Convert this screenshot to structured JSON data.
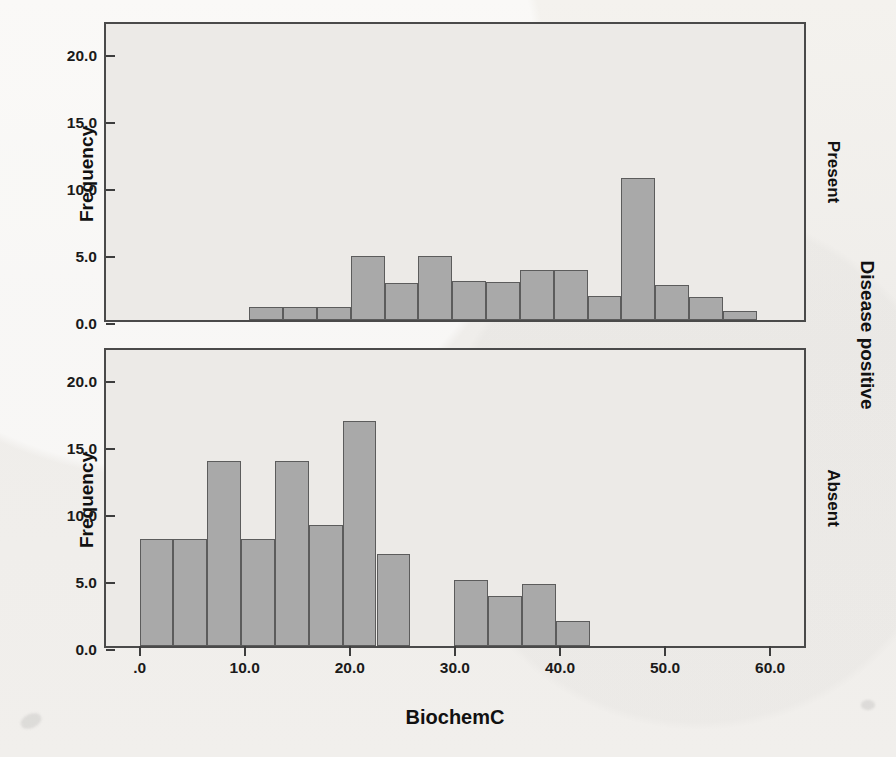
{
  "chart_data": {
    "type": "bar",
    "title": "",
    "xlabel": "BiochemC",
    "ylabel": "Frequency",
    "grid": false,
    "legend": "none",
    "panel_label": "Disease positive",
    "xlim": [
      -3.2,
      63.6
    ],
    "ylim": [
      0,
      22.4
    ],
    "xticks": [
      ".0",
      "10.0",
      "20.0",
      "30.0",
      "40.0",
      "50.0",
      "60.0"
    ],
    "xtick_values": [
      0,
      10,
      20,
      30,
      40,
      50,
      60
    ],
    "yticks": [
      "0.0",
      "5.0",
      "10.0",
      "15.0",
      "20.0"
    ],
    "ytick_values": [
      0,
      5,
      10,
      15,
      20
    ],
    "bin_width": 3.22,
    "bar_color": "#a9a9a9",
    "bar_edge_color": "#5c5c5c",
    "panels": [
      {
        "name": "Present",
        "row": 0,
        "bins": [
          {
            "x0": 10.43,
            "x1": 13.65,
            "value": 0.95
          },
          {
            "x0": 13.65,
            "x1": 16.87,
            "value": 0.95
          },
          {
            "x0": 16.87,
            "x1": 20.09,
            "value": 0.95
          },
          {
            "x0": 20.09,
            "x1": 23.31,
            "value": 4.75
          },
          {
            "x0": 23.31,
            "x1": 26.53,
            "value": 2.8
          },
          {
            "x0": 26.53,
            "x1": 29.75,
            "value": 4.75
          },
          {
            "x0": 29.75,
            "x1": 32.97,
            "value": 2.95
          },
          {
            "x0": 32.97,
            "x1": 36.19,
            "value": 2.85
          },
          {
            "x0": 36.19,
            "x1": 39.41,
            "value": 3.75
          },
          {
            "x0": 39.41,
            "x1": 42.63,
            "value": 3.75
          },
          {
            "x0": 42.63,
            "x1": 45.85,
            "value": 1.8
          },
          {
            "x0": 45.85,
            "x1": 49.07,
            "value": 10.6
          },
          {
            "x0": 49.07,
            "x1": 52.29,
            "value": 2.65
          },
          {
            "x0": 52.29,
            "x1": 55.51,
            "value": 1.75
          },
          {
            "x0": 55.51,
            "x1": 58.73,
            "value": 0.7
          }
        ]
      },
      {
        "name": "Absent",
        "row": 1,
        "bins": [
          {
            "x0": 0.0,
            "x1": 3.22,
            "value": 8.0
          },
          {
            "x0": 3.22,
            "x1": 6.44,
            "value": 8.0
          },
          {
            "x0": 6.44,
            "x1": 9.66,
            "value": 13.8
          },
          {
            "x0": 9.66,
            "x1": 12.88,
            "value": 8.0
          },
          {
            "x0": 12.88,
            "x1": 16.1,
            "value": 13.8
          },
          {
            "x0": 16.1,
            "x1": 19.32,
            "value": 9.0
          },
          {
            "x0": 19.32,
            "x1": 22.54,
            "value": 16.8
          },
          {
            "x0": 22.54,
            "x1": 25.76,
            "value": 6.9
          },
          {
            "x0": 29.95,
            "x1": 33.17,
            "value": 4.95
          },
          {
            "x0": 33.17,
            "x1": 36.39,
            "value": 3.7
          },
          {
            "x0": 36.39,
            "x1": 39.61,
            "value": 4.6
          },
          {
            "x0": 39.61,
            "x1": 42.83,
            "value": 1.85
          }
        ]
      }
    ]
  }
}
